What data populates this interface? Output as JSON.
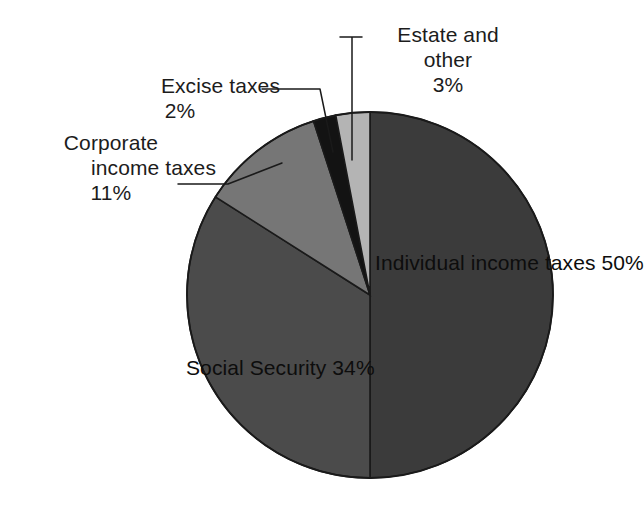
{
  "chart_data": {
    "type": "pie",
    "title": "",
    "subtitle": "",
    "xlabel": "",
    "ylabel": "",
    "legend_position": "none",
    "grid": false,
    "units": "percent",
    "start_angle_deg": 0,
    "direction": "clockwise",
    "categories": [
      "Individual income taxes",
      "Social Security",
      "Corporate income taxes",
      "Excise taxes",
      "Estate and other"
    ],
    "values": [
      50,
      34,
      11,
      2,
      3
    ],
    "slices": [
      {
        "name": "Individual income taxes",
        "label_line1": "Individual",
        "label_line2": "income taxes",
        "value_text": "50%",
        "value": 50,
        "color": "#3b3b3b",
        "start_deg": 0,
        "end_deg": 180,
        "label_placement": "inside"
      },
      {
        "name": "Social Security",
        "label_line1": "Social Security",
        "label_line2": "",
        "value_text": "34%",
        "value": 34,
        "color": "#4b4b4b",
        "start_deg": 180,
        "end_deg": 302.4,
        "label_placement": "inside"
      },
      {
        "name": "Corporate income taxes",
        "label_line1": "Corporate",
        "label_line2": "income taxes",
        "value_text": "11%",
        "value": 11,
        "color": "#767676",
        "start_deg": 302.4,
        "end_deg": 342,
        "label_placement": "outside-left"
      },
      {
        "name": "Excise taxes",
        "label_line1": "Excise taxes",
        "label_line2": "",
        "value_text": "2%",
        "value": 2,
        "color": "#131313",
        "start_deg": 342,
        "end_deg": 349.2,
        "label_placement": "outside-left"
      },
      {
        "name": "Estate and other",
        "label_line1": "Estate and",
        "label_line2": "other",
        "value_text": "3%",
        "value": 3,
        "color": "#b4b4b4",
        "start_deg": 349.2,
        "end_deg": 360,
        "label_placement": "outside-top"
      }
    ]
  },
  "figure": {
    "background_color": "#ffffff",
    "outline_color": "#1a1a1a",
    "center_x": 370,
    "center_y": 295,
    "radius": 183
  }
}
